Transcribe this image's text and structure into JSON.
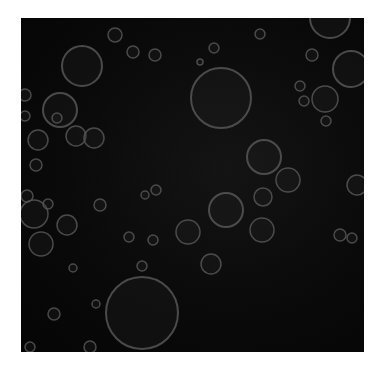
{
  "image": {
    "description": "Dark square texture with scattered translucent grey bubbles (ring outlines) of varying sizes",
    "background_color": "#0a0a0a",
    "ring_color": "#5a5a5a",
    "frame": {
      "x": 21,
      "y": 18,
      "width": 343,
      "height": 334
    },
    "bubbles": [
      {
        "cx": 82,
        "cy": 66,
        "r": 20
      },
      {
        "cx": 60,
        "cy": 110,
        "r": 17
      },
      {
        "cx": 76,
        "cy": 136,
        "r": 10
      },
      {
        "cx": 94,
        "cy": 138,
        "r": 10
      },
      {
        "cx": 115,
        "cy": 35,
        "r": 7
      },
      {
        "cx": 133,
        "cy": 52,
        "r": 6
      },
      {
        "cx": 155,
        "cy": 55,
        "r": 6
      },
      {
        "cx": 38,
        "cy": 140,
        "r": 10
      },
      {
        "cx": 36,
        "cy": 165,
        "r": 6
      },
      {
        "cx": 57,
        "cy": 118,
        "r": 5
      },
      {
        "cx": 25,
        "cy": 95,
        "r": 6
      },
      {
        "cx": 25,
        "cy": 116,
        "r": 5
      },
      {
        "cx": 221,
        "cy": 98,
        "r": 30
      },
      {
        "cx": 264,
        "cy": 157,
        "r": 17
      },
      {
        "cx": 288,
        "cy": 180,
        "r": 12
      },
      {
        "cx": 214,
        "cy": 48,
        "r": 5
      },
      {
        "cx": 260,
        "cy": 34,
        "r": 5
      },
      {
        "cx": 312,
        "cy": 55,
        "r": 6
      },
      {
        "cx": 351,
        "cy": 69,
        "r": 18
      },
      {
        "cx": 325,
        "cy": 99,
        "r": 13
      },
      {
        "cx": 300,
        "cy": 86,
        "r": 5
      },
      {
        "cx": 304,
        "cy": 101,
        "r": 5
      },
      {
        "cx": 326,
        "cy": 121,
        "r": 5
      },
      {
        "cx": 226,
        "cy": 210,
        "r": 17
      },
      {
        "cx": 262,
        "cy": 230,
        "r": 12
      },
      {
        "cx": 263,
        "cy": 197,
        "r": 9
      },
      {
        "cx": 188,
        "cy": 232,
        "r": 12
      },
      {
        "cx": 211,
        "cy": 264,
        "r": 10
      },
      {
        "cx": 357,
        "cy": 185,
        "r": 10
      },
      {
        "cx": 34,
        "cy": 214,
        "r": 14
      },
      {
        "cx": 41,
        "cy": 244,
        "r": 12
      },
      {
        "cx": 67,
        "cy": 225,
        "r": 10
      },
      {
        "cx": 48,
        "cy": 204,
        "r": 5
      },
      {
        "cx": 27,
        "cy": 196,
        "r": 6
      },
      {
        "cx": 73,
        "cy": 268,
        "r": 4
      },
      {
        "cx": 100,
        "cy": 205,
        "r": 6
      },
      {
        "cx": 129,
        "cy": 237,
        "r": 5
      },
      {
        "cx": 153,
        "cy": 240,
        "r": 5
      },
      {
        "cx": 142,
        "cy": 266,
        "r": 5
      },
      {
        "cx": 142,
        "cy": 313,
        "r": 36
      },
      {
        "cx": 54,
        "cy": 314,
        "r": 6
      },
      {
        "cx": 96,
        "cy": 304,
        "r": 4
      },
      {
        "cx": 90,
        "cy": 347,
        "r": 6
      },
      {
        "cx": 340,
        "cy": 235,
        "r": 6
      },
      {
        "cx": 352,
        "cy": 238,
        "r": 5
      },
      {
        "cx": 156,
        "cy": 190,
        "r": 5
      },
      {
        "cx": 145,
        "cy": 195,
        "r": 4
      },
      {
        "cx": 330,
        "cy": 18,
        "r": 20
      },
      {
        "cx": 200,
        "cy": 62,
        "r": 3
      },
      {
        "cx": 30,
        "cy": 347,
        "r": 5
      }
    ]
  }
}
